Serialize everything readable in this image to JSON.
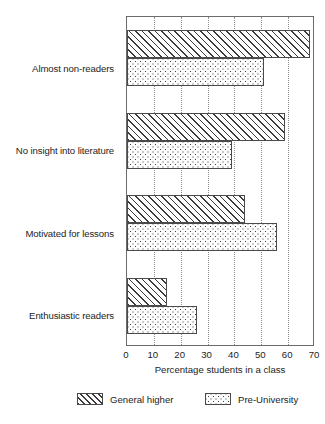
{
  "chart_data": {
    "type": "bar",
    "orientation": "horizontal",
    "title": "",
    "xlabel": "Percentage students in a class",
    "ylabel": "",
    "xlim": [
      0,
      70
    ],
    "xticks": [
      0,
      10,
      20,
      30,
      40,
      50,
      60,
      70
    ],
    "grid": "vertical-dotted",
    "legend_position": "bottom",
    "categories": [
      "Almost non-readers",
      "No insight into literature",
      "Motivated for lessons",
      "Enthusiastic readers"
    ],
    "series": [
      {
        "name": "General higher",
        "pattern": "diagonal-hatch",
        "values": [
          68,
          59,
          44,
          15
        ]
      },
      {
        "name": "Pre-University",
        "pattern": "dotted",
        "values": [
          51,
          39,
          56,
          26
        ]
      }
    ]
  },
  "axis": {
    "x_title": "Percentage students in a class",
    "tick_labels": [
      "0",
      "10",
      "20",
      "30",
      "40",
      "50",
      "60",
      "70"
    ]
  },
  "legend": {
    "items": [
      {
        "label": "General higher",
        "pattern": "diagonal-hatch"
      },
      {
        "label": "Pre-University",
        "pattern": "dotted"
      }
    ]
  }
}
